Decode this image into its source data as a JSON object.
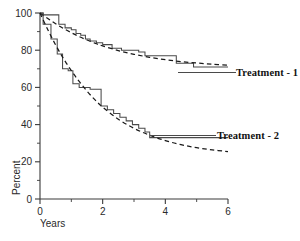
{
  "chart_data": {
    "type": "line",
    "title": "",
    "subtitle": "",
    "xlabel": "Years",
    "ylabel": "Percent",
    "xlim": [
      0,
      6
    ],
    "ylim": [
      0,
      100
    ],
    "grid": false,
    "legend_position": "right-inline",
    "x_ticks_major": [
      0,
      2,
      4,
      6
    ],
    "x_ticks_minor": [
      1,
      3,
      5
    ],
    "x_tick_labels": [
      "0",
      "2",
      "4",
      "6"
    ],
    "y_ticks_major": [
      0,
      20,
      40,
      60,
      80,
      100
    ],
    "y_ticks_minor": [
      10,
      30,
      50,
      70,
      90
    ],
    "y_tick_labels": [
      "0",
      "20",
      "40",
      "60",
      "80",
      "100"
    ],
    "annotations": [
      {
        "text": "Treatment - 1",
        "x": 6.0,
        "y": 72
      },
      {
        "text": "Treatment - 2",
        "x": 6.0,
        "y": 36
      }
    ],
    "series": [
      {
        "name": "Treatment - 1",
        "style": "step",
        "label": "Treatment - 1",
        "x": [
          0.0,
          0.1,
          0.1,
          0.6,
          0.6,
          0.8,
          0.8,
          1.0,
          1.0,
          1.15,
          1.15,
          1.3,
          1.3,
          1.45,
          1.45,
          1.6,
          1.6,
          1.8,
          1.8,
          2.0,
          2.0,
          2.3,
          2.3,
          2.6,
          2.6,
          3.15,
          3.15,
          3.35,
          3.35,
          4.35,
          4.35,
          4.9,
          4.9,
          6.0
        ],
        "y": [
          100,
          100,
          99,
          99,
          94,
          94,
          92,
          92,
          91,
          91,
          89,
          89,
          88,
          88,
          86,
          86,
          85,
          85,
          84,
          84,
          83,
          83,
          81,
          81,
          80,
          80,
          79,
          79,
          77,
          77,
          73,
          73,
          71,
          71
        ]
      },
      {
        "name": "Treatment - 1 fitted",
        "style": "dashed-fit",
        "label": "",
        "x": [
          0.0,
          0.25,
          0.5,
          0.75,
          1.0,
          1.25,
          1.5,
          1.75,
          2.0,
          2.5,
          3.0,
          3.5,
          4.0,
          4.5,
          5.0,
          5.5,
          6.0
        ],
        "y": [
          100,
          97.0,
          94.2,
          91.7,
          89.4,
          87.3,
          85.5,
          83.8,
          82.3,
          79.8,
          77.8,
          76.2,
          74.9,
          73.9,
          73.1,
          72.5,
          72.0
        ]
      },
      {
        "name": "Treatment - 2",
        "style": "step",
        "label": "Treatment - 2",
        "x": [
          0.0,
          0.1,
          0.1,
          0.35,
          0.35,
          0.55,
          0.55,
          0.72,
          0.72,
          0.9,
          0.9,
          1.05,
          1.05,
          1.25,
          1.25,
          1.6,
          1.6,
          1.95,
          1.95,
          2.15,
          2.15,
          2.35,
          2.35,
          2.55,
          2.55,
          2.75,
          2.75,
          2.95,
          2.95,
          3.15,
          3.15,
          3.35,
          3.35,
          3.5,
          3.5,
          6.0
        ],
        "y": [
          100,
          100,
          94,
          94,
          86,
          86,
          78,
          78,
          70,
          70,
          69,
          69,
          62,
          62,
          60,
          60,
          59,
          59,
          50,
          50,
          48,
          48,
          46,
          46,
          44,
          44,
          42,
          42,
          40,
          40,
          38,
          38,
          36,
          36,
          33,
          33
        ]
      },
      {
        "name": "Treatment - 2 fitted",
        "style": "dashed-fit",
        "label": "",
        "x": [
          0.0,
          0.25,
          0.5,
          0.75,
          1.0,
          1.25,
          1.5,
          1.75,
          2.0,
          2.5,
          3.0,
          3.5,
          4.0,
          4.5,
          5.0,
          5.5,
          6.0
        ],
        "y": [
          100,
          91.0,
          82.8,
          75.5,
          69.0,
          63.2,
          58.0,
          53.4,
          49.4,
          42.9,
          38.0,
          34.3,
          31.4,
          29.2,
          27.6,
          26.4,
          25.5
        ]
      }
    ]
  }
}
